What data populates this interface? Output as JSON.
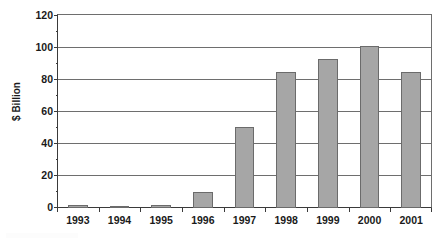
{
  "chart_data": {
    "type": "bar",
    "title": "",
    "subtitle": "",
    "xlabel": "",
    "ylabel": "$ Billion",
    "categories": [
      "1993",
      "1994",
      "1995",
      "1996",
      "1997",
      "1998",
      "1999",
      "2000",
      "2001"
    ],
    "values": [
      2,
      1,
      2,
      10,
      50,
      84,
      92,
      100,
      84
    ],
    "series": [
      {
        "name": "$ Billion",
        "values": [
          2,
          1,
          2,
          10,
          50,
          84,
          92,
          100,
          84
        ]
      }
    ],
    "ylim": [
      0,
      120
    ],
    "y_ticks": [
      0,
      20,
      40,
      60,
      80,
      100,
      120
    ],
    "y_tick_labels": [
      "0",
      "20",
      "40",
      "60",
      "80",
      "100",
      "120"
    ],
    "y_minor_ticks": [
      10,
      30,
      50,
      70,
      90,
      110
    ],
    "grid": "horizontal",
    "legend": "none",
    "bar_color": "#a6a6a6",
    "bar_border_color": "#6b6b6b",
    "axis_color": "#3a3a3a",
    "gridline_color": "#6e6e6e",
    "plot_background": "#ffffff",
    "text_color": "#1a1a1a"
  }
}
